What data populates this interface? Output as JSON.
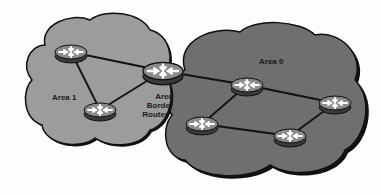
{
  "diagram": {
    "type": "network-topology",
    "areas": [
      {
        "id": "area1",
        "label": "Area 1",
        "fill": "#9c9c9c"
      },
      {
        "id": "area0",
        "label": "Area 0",
        "fill": "#6f6f6f"
      }
    ],
    "abr_label_lines": [
      "Area",
      "Border",
      "Router"
    ],
    "routers": [
      {
        "id": "r1",
        "area": "Area 1",
        "cx": 71,
        "cy": 52
      },
      {
        "id": "r2",
        "area": "Area 1",
        "cx": 100,
        "cy": 110
      },
      {
        "id": "abr",
        "area": "Area Border Router",
        "cx": 163,
        "cy": 71
      },
      {
        "id": "r3",
        "area": "Area 0",
        "cx": 247,
        "cy": 85
      },
      {
        "id": "r4",
        "area": "Area 0",
        "cx": 335,
        "cy": 103
      },
      {
        "id": "r5",
        "area": "Area 0",
        "cx": 202,
        "cy": 124
      },
      {
        "id": "r6",
        "area": "Area 0",
        "cx": 290,
        "cy": 136
      }
    ],
    "links": [
      [
        "r1",
        "r2"
      ],
      [
        "r1",
        "abr"
      ],
      [
        "r2",
        "abr"
      ],
      [
        "abr",
        "r3"
      ],
      [
        "r3",
        "r4"
      ],
      [
        "r3",
        "r5"
      ],
      [
        "r5",
        "r6"
      ],
      [
        "r6",
        "r4"
      ]
    ]
  }
}
